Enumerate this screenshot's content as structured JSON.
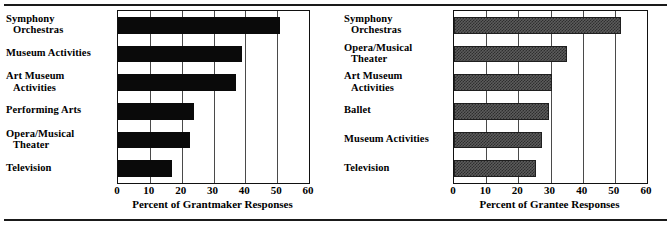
{
  "figure": {
    "top_rule": "",
    "bottom_rule": ""
  },
  "chart_data": [
    {
      "type": "bar",
      "orientation": "horizontal",
      "panel": "left",
      "title": "",
      "xlabel": "Percent of Grantmaker Responses",
      "ylabel": "",
      "xlim": [
        0,
        60
      ],
      "xticks": [
        0,
        10,
        20,
        30,
        40,
        50,
        60
      ],
      "xtick_labels": [
        "0",
        "10",
        "20",
        "30",
        "40",
        "50",
        "60"
      ],
      "grid": true,
      "legend": false,
      "bar_style": "solid-black",
      "bar_color": "#0a0a0a",
      "categories": [
        "Symphony Orchestras",
        "Museum Activities",
        "Art Museum Activities",
        "Performing Arts",
        "Opera/Musical Theater",
        "Television"
      ],
      "category_lines": [
        [
          "Symphony",
          "Orchestras"
        ],
        [
          "Museum Activities"
        ],
        [
          "Art  Museum",
          "Activities"
        ],
        [
          "Performing Arts"
        ],
        [
          "Opera/Musical",
          "Theater"
        ],
        [
          "Television"
        ]
      ],
      "values": [
        51,
        39,
        37,
        24,
        22.5,
        17
      ]
    },
    {
      "type": "bar",
      "orientation": "horizontal",
      "panel": "right",
      "title": "",
      "xlabel": "Percent of Grantee Responses",
      "ylabel": "",
      "xlim": [
        0,
        60
      ],
      "xticks": [
        0,
        10,
        20,
        30,
        40,
        50,
        60
      ],
      "xtick_labels": [
        "0",
        "10",
        "20",
        "30",
        "40",
        "50",
        "60"
      ],
      "grid": true,
      "legend": false,
      "bar_style": "checkered-gray-hatch",
      "bar_color": "#5c5c5c",
      "categories": [
        "Symphony Orchestras",
        "Opera/Musical Theater",
        "Art Museum Activities",
        "Ballet",
        "Museum Activities",
        "Television"
      ],
      "category_lines": [
        [
          "Symphony",
          "Orchestras"
        ],
        [
          "Opera/Musical",
          "Theater"
        ],
        [
          "Art  Museum",
          "Activities"
        ],
        [
          "Ballet"
        ],
        [
          "Museum Activities"
        ],
        [
          "Television"
        ]
      ],
      "values": [
        52,
        35,
        30.5,
        29.5,
        27.5,
        25.5
      ]
    }
  ]
}
